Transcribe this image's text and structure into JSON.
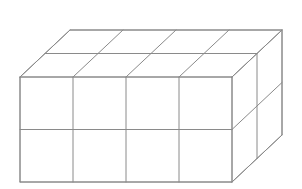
{
  "figure": {
    "type": "isometric-line-drawing",
    "background_color": "#ffffff",
    "line_color": "#8a8a8a",
    "line_color_light": "#a9a9a9",
    "line_width": 1,
    "face_fill": "#ffffff",
    "dimensions": {
      "width_units": 4,
      "height_units": 2,
      "depth_units": 2,
      "total_cubes": 16,
      "width_label": "4",
      "height_label": "2",
      "depth_label": "2",
      "total_label": "16"
    },
    "geometry": {
      "front_top_left_x": 20,
      "front_top_left_y": 77,
      "cell_width": 53,
      "cell_height": 52.5,
      "depth_dx": 25,
      "depth_dy": -23.5,
      "canvas_width": 302,
      "canvas_height": 189
    },
    "faces": {
      "top_label": "top face",
      "front_label": "front face",
      "right_label": "right face"
    },
    "annotations": []
  }
}
